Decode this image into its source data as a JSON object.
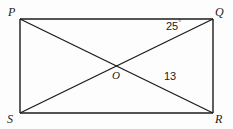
{
  "figure": {
    "background_color": "#fdfdfd",
    "stroke_color": "#1b1b1b",
    "text_color": "#1b1b1b"
  },
  "vertices": {
    "top_left": "P",
    "top_right": "Q",
    "bottom_right": "R",
    "bottom_left": "S",
    "center": "O"
  },
  "annotations": {
    "angle_at_q": "25",
    "angle_degree_symbol": "°",
    "segment_or_length": "13"
  },
  "geometry": {
    "rect": {
      "x1": 20,
      "y1": 19,
      "x2": 213,
      "y2": 113
    },
    "intersection": {
      "x": 118,
      "y": 67
    },
    "diagonals": [
      {
        "name": "P-R",
        "from": [
          20,
          19
        ],
        "to": [
          213,
          113
        ]
      },
      {
        "name": "S-Q",
        "from": [
          20,
          113
        ],
        "to": [
          213,
          19
        ]
      }
    ]
  }
}
